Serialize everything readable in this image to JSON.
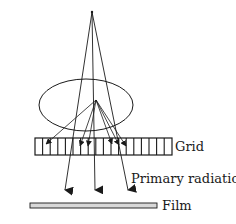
{
  "diagram": {
    "title": "",
    "labels": {
      "grid": "Grid",
      "primary_radiation": "Primary radiation",
      "film": "Film"
    },
    "colors": {
      "stroke": "#1a1a1a",
      "film_fill": "#d8d8d8",
      "background": "#ffffff"
    },
    "elements": [
      {
        "id": "source-point",
        "type": "point",
        "x": 92,
        "y": 12
      },
      {
        "id": "patient-body",
        "type": "ellipse",
        "cx": 86,
        "cy": 105,
        "rx": 47,
        "ry": 26
      },
      {
        "id": "grid",
        "type": "rect",
        "x": 35,
        "y": 138,
        "width": 137,
        "height": 17,
        "slats": 18
      },
      {
        "id": "film",
        "type": "rect",
        "x": 30,
        "y": 203,
        "width": 127,
        "height": 5
      }
    ],
    "primary_rays": [
      {
        "from": [
          92,
          12
        ],
        "to": [
          65,
          197
        ]
      },
      {
        "from": [
          92,
          12
        ],
        "to": [
          95,
          197
        ]
      },
      {
        "from": [
          92,
          12
        ],
        "to": [
          128,
          197
        ]
      }
    ],
    "scatter_origin": [
      96,
      100
    ],
    "scatter_rays": [
      {
        "to": [
          45,
          145
        ]
      },
      {
        "to": [
          80,
          146
        ]
      },
      {
        "to": [
          88,
          146
        ]
      },
      {
        "to": [
          112,
          144
        ]
      },
      {
        "to": [
          119,
          145
        ]
      },
      {
        "to": [
          126,
          146
        ]
      }
    ]
  }
}
